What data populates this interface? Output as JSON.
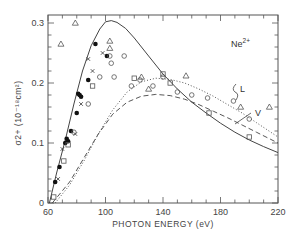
{
  "chart_data": {
    "type": "scatter",
    "title": "",
    "annotation": "Ne2+",
    "xlabel": "PHOTON  ENERGY (eV)",
    "ylabel": "σ2+ (10⁻¹⁸cm²)",
    "xlim": [
      60,
      220
    ],
    "ylim": [
      0,
      0.31
    ],
    "x_ticks": [
      60,
      100,
      140,
      180,
      220
    ],
    "y_ticks": [
      0,
      0.1,
      0.2,
      0.3
    ],
    "x_tick_labels": [
      "60",
      "100",
      "140",
      "180",
      "220"
    ],
    "y_tick_labels": [
      "0",
      "0.1",
      "0.2",
      "0.3"
    ],
    "grid": false,
    "curves": [
      {
        "name": "solid",
        "style": "solid",
        "x": [
          61,
          66,
          72,
          78,
          84,
          90,
          96,
          100,
          104,
          108,
          114,
          120,
          130,
          140,
          150,
          160,
          170,
          180,
          190,
          200,
          210,
          220
        ],
        "y": [
          0.0,
          0.05,
          0.105,
          0.165,
          0.22,
          0.262,
          0.29,
          0.302,
          0.304,
          0.301,
          0.291,
          0.275,
          0.245,
          0.215,
          0.19,
          0.168,
          0.15,
          0.133,
          0.118,
          0.105,
          0.094,
          0.084
        ]
      },
      {
        "name": "L",
        "style": "dotted",
        "x": [
          65,
          75,
          85,
          95,
          105,
          115,
          125,
          135,
          145,
          155,
          165,
          175,
          185,
          195,
          205,
          215,
          220
        ],
        "y": [
          0.0,
          0.03,
          0.07,
          0.115,
          0.155,
          0.185,
          0.202,
          0.208,
          0.206,
          0.2,
          0.19,
          0.178,
          0.164,
          0.15,
          0.134,
          0.118,
          0.11
        ]
      },
      {
        "name": "V",
        "style": "dashed",
        "x": [
          63,
          75,
          85,
          95,
          105,
          115,
          125,
          135,
          145,
          155,
          165,
          175,
          185,
          195,
          205,
          215,
          220
        ],
        "y": [
          0.0,
          0.035,
          0.075,
          0.115,
          0.148,
          0.168,
          0.178,
          0.181,
          0.179,
          0.173,
          0.164,
          0.153,
          0.142,
          0.13,
          0.118,
          0.106,
          0.1
        ]
      }
    ],
    "series": [
      {
        "name": "filled circles",
        "marker": "filled-circle",
        "points": [
          [
            65,
            0.035
          ],
          [
            68,
            0.06
          ],
          [
            72,
            0.1
          ],
          [
            73,
            0.107
          ],
          [
            74,
            0.103
          ],
          [
            76,
            0.12
          ],
          [
            80,
            0.15
          ],
          [
            81,
            0.182
          ],
          [
            82,
            0.18
          ],
          [
            83,
            0.177
          ],
          [
            88,
            0.205
          ],
          [
            93,
            0.265
          ],
          [
            101,
            0.245
          ]
        ]
      },
      {
        "name": "crosses",
        "marker": "cross",
        "points": [
          [
            67,
            0.04
          ],
          [
            70,
            0.09
          ],
          [
            79,
            0.115
          ],
          [
            83,
            0.165
          ],
          [
            88,
            0.24
          ],
          [
            91,
            0.22
          ],
          [
            98,
            0.25
          ]
        ]
      },
      {
        "name": "open circles",
        "marker": "open-circle",
        "points": [
          [
            78,
            0.118
          ],
          [
            88,
            0.165
          ],
          [
            96,
            0.21
          ],
          [
            103,
            0.245
          ],
          [
            104,
            0.233
          ],
          [
            106,
            0.21
          ],
          [
            113,
            0.245
          ],
          [
            118,
            0.195
          ],
          [
            124,
            0.205
          ],
          [
            133,
            0.195
          ],
          [
            140,
            0.21
          ],
          [
            150,
            0.185
          ],
          [
            160,
            0.18
          ],
          [
            171,
            0.175
          ],
          [
            189,
            0.17
          ],
          [
            200,
            0.14
          ]
        ]
      },
      {
        "name": "squares",
        "marker": "open-square",
        "points": [
          [
            64,
            0.01
          ],
          [
            71,
            0.07
          ],
          [
            74,
            0.097
          ],
          [
            91,
            0.195
          ],
          [
            120,
            0.208
          ],
          [
            140,
            0.215
          ],
          [
            145,
            0.2
          ],
          [
            172,
            0.15
          ],
          [
            200,
            0.11
          ]
        ]
      },
      {
        "name": "triangles",
        "marker": "open-triangle",
        "points": [
          [
            79,
            0.3
          ],
          [
            69,
            0.265
          ],
          [
            103,
            0.258
          ],
          [
            103,
            0.27
          ],
          [
            130,
            0.19
          ],
          [
            125,
            0.21
          ],
          [
            156,
            0.212
          ],
          [
            194,
            0.16
          ],
          [
            214,
            0.16
          ]
        ]
      }
    ],
    "legend": {
      "position": "inline",
      "entries": [
        "L",
        "V"
      ]
    }
  }
}
